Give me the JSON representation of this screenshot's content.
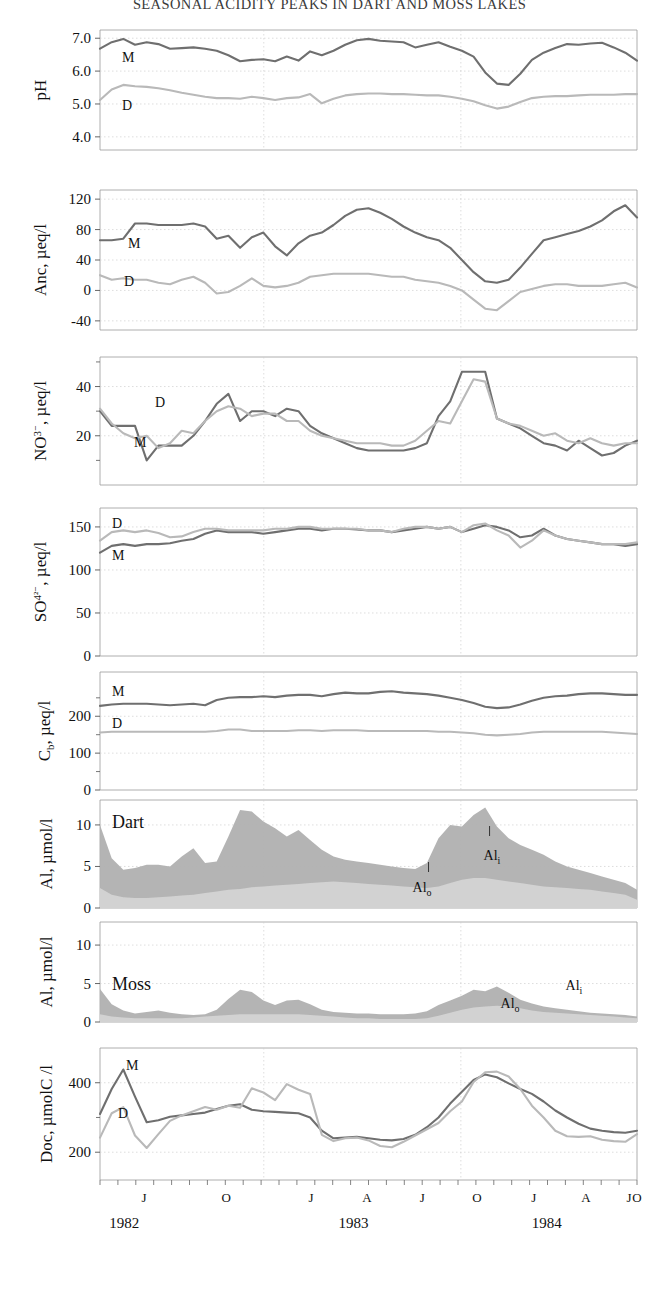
{
  "title": "SEASONAL ACIDITY PEAKS IN DART AND MOSS LAKES",
  "axis": {
    "x_month_ticks": [
      "J",
      "O",
      "J",
      "A",
      "J",
      "O",
      "J",
      "A",
      "J",
      "O"
    ],
    "x_year_ticks": [
      "1982",
      "1983",
      "1984"
    ]
  },
  "series_labels": {
    "moss": "M",
    "dart": "D",
    "al_inorganic": "Al",
    "al_organic": "Al",
    "al_inorganic_sub": "i",
    "al_organic_sub": "o",
    "panel_dart": "Dart",
    "panel_moss": "Moss"
  },
  "colors": {
    "moss_line": "#6f6f6f",
    "dart_line": "#b9b9b9",
    "al_inorganic_fill": "#b0b0b0",
    "al_organic_fill": "#d2d2d2",
    "axis": "#9a9a9a",
    "grid": "#cfcfcf",
    "text": "#111111"
  },
  "chart_data": [
    {
      "type": "line",
      "title": "pH",
      "ylabel": "pH",
      "xlabel": "",
      "ylim": [
        3.6,
        7.25
      ],
      "yticks": [
        7.0,
        6.0,
        5.0,
        4.0
      ],
      "ytick_labels": [
        "7.0",
        "6.0",
        "5.0",
        "4.0"
      ],
      "grid": true,
      "legend": [
        "M",
        "D"
      ],
      "series": [
        {
          "name": "M",
          "label": "M",
          "color": "#6f6f6f",
          "values": [
            6.68,
            6.88,
            6.98,
            6.8,
            6.88,
            6.82,
            6.68,
            6.7,
            6.72,
            6.68,
            6.62,
            6.48,
            6.3,
            6.34,
            6.36,
            6.3,
            6.44,
            6.32,
            6.6,
            6.48,
            6.62,
            6.8,
            6.94,
            6.98,
            6.92,
            6.9,
            6.88,
            6.72,
            6.8,
            6.88,
            6.74,
            6.62,
            6.44,
            5.96,
            5.62,
            5.58,
            5.92,
            6.34,
            6.56,
            6.7,
            6.82,
            6.8,
            6.84,
            6.86,
            6.72,
            6.56,
            6.32
          ]
        },
        {
          "name": "D",
          "label": "D",
          "color": "#b9b9b9",
          "values": [
            5.12,
            5.44,
            5.58,
            5.54,
            5.52,
            5.48,
            5.42,
            5.34,
            5.28,
            5.22,
            5.18,
            5.18,
            5.16,
            5.22,
            5.18,
            5.12,
            5.18,
            5.2,
            5.3,
            5.02,
            5.16,
            5.26,
            5.3,
            5.32,
            5.32,
            5.3,
            5.3,
            5.28,
            5.26,
            5.26,
            5.22,
            5.16,
            5.08,
            4.96,
            4.86,
            4.92,
            5.06,
            5.18,
            5.22,
            5.24,
            5.24,
            5.26,
            5.28,
            5.28,
            5.28,
            5.3,
            5.3
          ]
        }
      ]
    },
    {
      "type": "line",
      "title": "ANC",
      "ylabel": "Anc, µeq/l",
      "xlabel": "",
      "ylim": [
        -52,
        132
      ],
      "yticks": [
        120,
        80,
        40,
        0,
        -40
      ],
      "ytick_labels": [
        "120",
        "80",
        "40",
        "0",
        "-40"
      ],
      "grid": true,
      "legend": [
        "M",
        "D"
      ],
      "series": [
        {
          "name": "M",
          "label": "M",
          "color": "#6f6f6f",
          "values": [
            66,
            66,
            68,
            88,
            88,
            86,
            86,
            86,
            88,
            84,
            68,
            72,
            56,
            70,
            76,
            58,
            46,
            62,
            72,
            76,
            86,
            98,
            106,
            108,
            102,
            94,
            84,
            76,
            70,
            66,
            56,
            40,
            24,
            12,
            10,
            14,
            30,
            48,
            66,
            70,
            74,
            78,
            84,
            92,
            104,
            112,
            96
          ]
        },
        {
          "name": "D",
          "label": "D",
          "color": "#b9b9b9",
          "values": [
            20,
            14,
            16,
            14,
            14,
            10,
            8,
            14,
            18,
            10,
            -4,
            -2,
            6,
            16,
            6,
            4,
            6,
            10,
            18,
            20,
            22,
            22,
            22,
            22,
            20,
            18,
            18,
            14,
            12,
            10,
            6,
            0,
            -12,
            -24,
            -26,
            -14,
            -2,
            2,
            6,
            8,
            8,
            6,
            6,
            6,
            8,
            10,
            4
          ]
        }
      ]
    },
    {
      "type": "line",
      "title": "NO3",
      "ylabel": "NO₃⁻, µeq/l",
      "xlabel": "",
      "ylim": [
        0,
        52
      ],
      "yticks": [
        40,
        20
      ],
      "ytick_labels": [
        "40",
        "20"
      ],
      "grid": true,
      "legend": [
        "D",
        "M"
      ],
      "series": [
        {
          "name": "M",
          "label": "M",
          "color": "#6f6f6f",
          "values": [
            30,
            24,
            24,
            24,
            10,
            16,
            16,
            16,
            20,
            26,
            33,
            37,
            26,
            30,
            30,
            28,
            31,
            30,
            24,
            21,
            19,
            17,
            15,
            14,
            14,
            14,
            14,
            15,
            17,
            28,
            34,
            46,
            46,
            46,
            27,
            25,
            23,
            20,
            17,
            16,
            14,
            18,
            15,
            12,
            13,
            16,
            18
          ]
        },
        {
          "name": "D",
          "label": "D",
          "color": "#b9b9b9",
          "values": [
            31,
            25,
            21,
            19,
            20,
            15,
            17,
            22,
            21,
            26,
            30,
            32,
            31,
            28,
            29,
            29,
            26,
            26,
            22,
            20,
            19,
            18,
            17,
            17,
            17,
            16,
            16,
            18,
            22,
            26,
            25,
            34,
            43,
            42,
            27,
            25,
            24,
            22,
            20,
            21,
            18,
            17,
            19,
            17,
            16,
            17,
            17
          ]
        }
      ]
    },
    {
      "type": "line",
      "title": "SO4",
      "ylabel": "SO₄²⁻, µeq/l",
      "xlabel": "",
      "ylim": [
        0,
        172
      ],
      "yticks": [
        150,
        100,
        50,
        0
      ],
      "ytick_labels": [
        "150",
        "100",
        "50",
        "0"
      ],
      "grid": true,
      "legend": [
        "D",
        "M"
      ],
      "series": [
        {
          "name": "M",
          "label": "M",
          "color": "#6f6f6f",
          "values": [
            120,
            128,
            130,
            128,
            130,
            130,
            131,
            134,
            136,
            142,
            146,
            144,
            144,
            144,
            142,
            144,
            146,
            148,
            148,
            146,
            148,
            148,
            147,
            146,
            146,
            144,
            146,
            148,
            150,
            148,
            150,
            144,
            148,
            152,
            150,
            146,
            138,
            140,
            148,
            140,
            136,
            134,
            132,
            130,
            130,
            128,
            130
          ]
        },
        {
          "name": "D",
          "label": "D",
          "color": "#b9b9b9",
          "values": [
            134,
            144,
            146,
            144,
            146,
            143,
            138,
            139,
            144,
            148,
            148,
            146,
            146,
            146,
            146,
            148,
            148,
            150,
            150,
            148,
            148,
            148,
            148,
            146,
            146,
            144,
            148,
            150,
            150,
            148,
            150,
            144,
            152,
            154,
            146,
            140,
            126,
            134,
            146,
            140,
            136,
            134,
            132,
            130,
            130,
            130,
            132
          ]
        }
      ]
    },
    {
      "type": "line",
      "title": "Cb",
      "ylabel": "Cₘ, µeq/l",
      "ylabel_text": "C",
      "ylabel_sub": "b",
      "ylabel_rest": ", µeq/l",
      "xlabel": "",
      "ylim": [
        0,
        320
      ],
      "yticks": [
        200,
        100,
        0
      ],
      "ytick_labels": [
        "200",
        "100",
        "0"
      ],
      "grid": true,
      "legend": [
        "M",
        "D"
      ],
      "series": [
        {
          "name": "M",
          "label": "M",
          "color": "#6f6f6f",
          "values": [
            228,
            232,
            234,
            234,
            234,
            232,
            230,
            232,
            234,
            230,
            244,
            250,
            252,
            252,
            254,
            252,
            256,
            258,
            258,
            254,
            260,
            264,
            262,
            262,
            266,
            268,
            264,
            262,
            260,
            256,
            250,
            244,
            236,
            226,
            222,
            224,
            232,
            242,
            250,
            254,
            256,
            260,
            262,
            262,
            260,
            258,
            258
          ]
        },
        {
          "name": "D",
          "label": "D",
          "color": "#b9b9b9",
          "values": [
            156,
            158,
            158,
            158,
            158,
            158,
            158,
            158,
            158,
            158,
            160,
            164,
            164,
            160,
            160,
            160,
            160,
            162,
            162,
            160,
            162,
            162,
            162,
            160,
            160,
            160,
            160,
            160,
            160,
            158,
            158,
            156,
            154,
            150,
            148,
            150,
            152,
            156,
            158,
            158,
            158,
            158,
            158,
            158,
            156,
            154,
            152
          ]
        }
      ]
    },
    {
      "type": "area",
      "title": "Al Dart",
      "panel_label": "Dart",
      "ylabel": "Al, µmol/l",
      "xlabel": "",
      "ylim": [
        0,
        13
      ],
      "yticks": [
        10,
        5,
        0
      ],
      "ytick_labels": [
        "10",
        "5",
        "0"
      ],
      "grid": true,
      "legend": [
        "Al i",
        "Al o"
      ],
      "annotations": [
        {
          "text": "Al",
          "sub": "i",
          "x_index": 32
        },
        {
          "text": "Al",
          "sub": "o",
          "x_index": 29
        }
      ],
      "series": [
        {
          "name": "Al_o",
          "label": "Al o",
          "color": "#d2d2d2",
          "stack": "lower",
          "values": [
            2.4,
            1.6,
            1.3,
            1.2,
            1.2,
            1.3,
            1.4,
            1.5,
            1.6,
            1.8,
            2.0,
            2.2,
            2.3,
            2.5,
            2.6,
            2.7,
            2.8,
            2.9,
            3.0,
            3.1,
            3.2,
            3.1,
            3.0,
            2.9,
            2.8,
            2.7,
            2.6,
            2.5,
            2.4,
            2.6,
            3.0,
            3.4,
            3.6,
            3.6,
            3.4,
            3.2,
            3.0,
            2.8,
            2.6,
            2.5,
            2.4,
            2.3,
            2.2,
            2.0,
            1.8,
            1.6,
            1.0
          ]
        },
        {
          "name": "Al_i",
          "label": "Al i",
          "color": "#b0b0b0",
          "stack": "upper",
          "values": [
            10.0,
            6.0,
            4.6,
            4.8,
            5.2,
            5.2,
            5.0,
            6.2,
            7.2,
            5.4,
            5.6,
            8.6,
            11.8,
            11.6,
            10.4,
            9.6,
            8.6,
            9.4,
            8.2,
            7.0,
            6.2,
            5.8,
            5.6,
            5.4,
            5.2,
            5.0,
            4.8,
            4.7,
            5.4,
            8.4,
            10.0,
            9.8,
            11.2,
            12.1,
            9.8,
            8.4,
            7.6,
            7.0,
            6.4,
            5.6,
            5.0,
            4.6,
            4.2,
            3.8,
            3.4,
            3.0,
            2.2
          ]
        }
      ]
    },
    {
      "type": "area",
      "title": "Al Moss",
      "panel_label": "Moss",
      "ylabel": "Al, µmol/l",
      "xlabel": "",
      "ylim": [
        0,
        13
      ],
      "yticks": [
        10,
        5,
        0
      ],
      "ytick_labels": [
        "10",
        "5",
        "0"
      ],
      "grid": true,
      "legend": [
        "Al i",
        "Al o"
      ],
      "annotations": [
        {
          "text": "Al",
          "sub": "i",
          "x_index": 38
        },
        {
          "text": "Al",
          "sub": "o",
          "x_index": 35
        }
      ],
      "series": [
        {
          "name": "Al_o",
          "label": "Al o",
          "color": "#d2d2d2",
          "stack": "lower",
          "values": [
            1.0,
            0.7,
            0.6,
            0.5,
            0.5,
            0.5,
            0.5,
            0.5,
            0.6,
            0.7,
            0.8,
            0.9,
            1.0,
            1.0,
            1.0,
            1.0,
            1.0,
            1.0,
            0.9,
            0.8,
            0.7,
            0.6,
            0.5,
            0.5,
            0.4,
            0.4,
            0.4,
            0.4,
            0.5,
            0.8,
            1.2,
            1.6,
            1.9,
            2.0,
            2.1,
            2.0,
            1.8,
            1.5,
            1.3,
            1.2,
            1.1,
            1.0,
            0.9,
            0.8,
            0.7,
            0.6,
            0.5
          ]
        },
        {
          "name": "Al_i",
          "label": "Al i",
          "color": "#b0b0b0",
          "stack": "upper",
          "values": [
            4.3,
            2.3,
            1.5,
            1.1,
            1.3,
            1.5,
            1.2,
            1.0,
            0.9,
            1.0,
            1.6,
            3.0,
            4.2,
            3.9,
            2.8,
            2.2,
            2.8,
            2.9,
            2.3,
            1.6,
            1.3,
            1.2,
            1.1,
            1.1,
            1.0,
            1.0,
            1.0,
            1.1,
            1.4,
            2.2,
            2.8,
            3.4,
            4.2,
            4.0,
            4.6,
            3.8,
            2.9,
            2.4,
            2.0,
            1.8,
            1.6,
            1.4,
            1.2,
            1.1,
            1.0,
            0.9,
            0.7
          ]
        }
      ]
    },
    {
      "type": "line",
      "title": "Doc",
      "ylabel": "Doc, µmolC /l",
      "xlabel": "",
      "ylim": [
        120,
        500
      ],
      "yticks": [
        400,
        200
      ],
      "ytick_labels": [
        "400",
        "200"
      ],
      "grid": true,
      "legend": [
        "M",
        "D"
      ],
      "series": [
        {
          "name": "M",
          "label": "M",
          "color": "#6f6f6f",
          "values": [
            310,
            382,
            438,
            360,
            286,
            292,
            302,
            306,
            310,
            314,
            324,
            334,
            338,
            322,
            318,
            316,
            314,
            312,
            300,
            262,
            240,
            242,
            244,
            240,
            236,
            234,
            238,
            250,
            272,
            300,
            340,
            374,
            408,
            424,
            416,
            398,
            382,
            368,
            346,
            320,
            300,
            282,
            268,
            262,
            258,
            256,
            262
          ]
        },
        {
          "name": "D",
          "label": "D",
          "color": "#b9b9b9",
          "values": [
            242,
            312,
            330,
            248,
            212,
            252,
            290,
            306,
            318,
            330,
            322,
            334,
            328,
            384,
            372,
            350,
            396,
            380,
            368,
            250,
            232,
            240,
            242,
            234,
            218,
            214,
            230,
            248,
            266,
            284,
            318,
            346,
            402,
            430,
            432,
            418,
            382,
            334,
            300,
            262,
            246,
            244,
            246,
            236,
            232,
            230,
            252
          ]
        }
      ]
    }
  ]
}
